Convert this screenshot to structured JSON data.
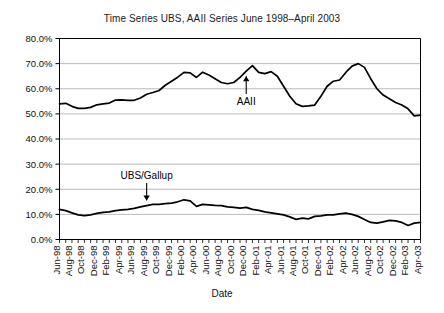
{
  "chart_data": {
    "type": "line",
    "title": "Time Series UBS, AAII Series June 1998–April 2003",
    "xlabel": "Date",
    "ylabel": "",
    "ylim": [
      0,
      0.8
    ],
    "ytick_labels": [
      "0.0%",
      "10.0%",
      "20.0%",
      "30.0%",
      "40.0%",
      "50.0%",
      "60.0%",
      "70.0%",
      "80.0%"
    ],
    "ytick_values": [
      0.0,
      10.0,
      20.0,
      30.0,
      40.0,
      50.0,
      60.0,
      70.0,
      80.0
    ],
    "grid": true,
    "grid_axis": "y",
    "legend": "none",
    "annotations": [
      {
        "text": "AAII",
        "series": "AAII",
        "x": "Dec-00",
        "arrow": "up"
      },
      {
        "text": "UBS/Gallup",
        "series": "UBS/Gallup",
        "x": "Aug-99",
        "arrow": "down"
      }
    ],
    "x": [
      "Jun-98",
      "Jul-98",
      "Aug-98",
      "Sep-98",
      "Oct-98",
      "Nov-98",
      "Dec-98",
      "Jan-99",
      "Feb-99",
      "Mar-99",
      "Apr-99",
      "May-99",
      "Jun-99",
      "Jul-99",
      "Aug-99",
      "Sep-99",
      "Oct-99",
      "Nov-99",
      "Dec-99",
      "Jan-00",
      "Feb-00",
      "Mar-00",
      "Apr-00",
      "May-00",
      "Jun-00",
      "Jul-00",
      "Aug-00",
      "Sep-00",
      "Oct-00",
      "Nov-00",
      "Dec-00",
      "Jan-01",
      "Feb-01",
      "Mar-01",
      "Apr-01",
      "May-01",
      "Jun-01",
      "Jul-01",
      "Aug-01",
      "Sep-01",
      "Oct-01",
      "Nov-01",
      "Dec-01",
      "Jan-02",
      "Feb-02",
      "Mar-02",
      "Apr-02",
      "May-02",
      "Jun-02",
      "Jul-02",
      "Aug-02",
      "Sep-02",
      "Oct-02",
      "Nov-02",
      "Dec-02",
      "Jan-03",
      "Feb-03",
      "Mar-03",
      "Apr-03"
    ],
    "xtick_labels": [
      "Jun-98",
      "Aug-98",
      "Oct-98",
      "Dec-98",
      "Feb-99",
      "Apr-99",
      "Jun-99",
      "Aug-99",
      "Oct-99",
      "Dec-99",
      "Feb-00",
      "Apr-00",
      "Jun-00",
      "Aug-00",
      "Oct-00",
      "Dec-00",
      "Feb-01",
      "Apr-01",
      "Jun-01",
      "Aug-01",
      "Oct-01",
      "Dec-01",
      "Feb-02",
      "Apr-02",
      "Jun-02",
      "Aug-02",
      "Oct-02",
      "Dec-02",
      "Feb-03",
      "Apr-03"
    ],
    "series": [
      {
        "name": "AAII",
        "values": [
          54.0,
          54.2,
          53.0,
          52.2,
          52.2,
          52.6,
          53.6,
          54.0,
          54.3,
          55.5,
          55.6,
          55.4,
          55.4,
          56.3,
          57.8,
          58.5,
          59.3,
          61.4,
          63.0,
          64.6,
          66.5,
          66.3,
          64.5,
          66.6,
          65.5,
          64.0,
          62.5,
          62.0,
          62.5,
          64.5,
          67.0,
          69.2,
          66.5,
          66.0,
          66.8,
          65.0,
          61.0,
          57.0,
          54.0,
          53.0,
          53.2,
          53.5,
          57.0,
          61.0,
          63.0,
          63.5,
          66.5,
          69.0,
          70.0,
          68.5,
          64.0,
          60.0,
          57.5,
          56.0,
          54.5,
          53.5,
          52.0,
          49.2,
          49.5
        ]
      },
      {
        "name": "UBS/Gallup",
        "values": [
          12.0,
          11.5,
          10.6,
          9.8,
          9.5,
          9.8,
          10.4,
          10.8,
          11.0,
          11.5,
          11.8,
          12.0,
          12.4,
          13.0,
          13.5,
          14.0,
          14.0,
          14.3,
          14.5,
          15.0,
          15.8,
          15.4,
          13.2,
          14.0,
          13.8,
          13.6,
          13.5,
          13.0,
          12.8,
          12.5,
          12.8,
          12.0,
          11.6,
          11.0,
          10.6,
          10.2,
          9.8,
          9.0,
          8.0,
          8.5,
          8.2,
          9.2,
          9.4,
          9.8,
          9.8,
          10.2,
          10.5,
          10.0,
          9.2,
          8.0,
          6.8,
          6.5,
          7.0,
          7.6,
          7.4,
          6.8,
          5.6,
          6.5,
          6.8
        ]
      }
    ]
  }
}
